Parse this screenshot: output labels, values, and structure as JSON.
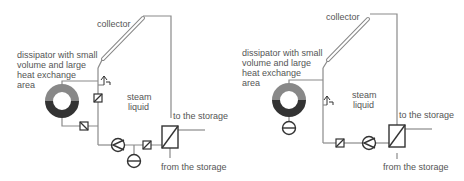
{
  "panels": [
    {
      "id": "left",
      "labels": {
        "collector": "collector",
        "dissipator_line1": "dissipator with small",
        "dissipator_line2": "volume and large",
        "dissipator_line3": "heat exchange",
        "dissipator_line4": "area",
        "steam": "steam",
        "liquid": "liquid",
        "to_storage": "to the storage",
        "from_storage": "from the storage"
      }
    },
    {
      "id": "right",
      "labels": {
        "collector": "collector",
        "dissipator_line1": "dissipator with small",
        "dissipator_line2": "volume and large",
        "dissipator_line3": "heat exchange",
        "dissipator_line4": "area",
        "steam": "steam",
        "liquid": "liquid",
        "to_storage": "to the storage",
        "from_storage": "from the storage"
      }
    }
  ],
  "colors": {
    "pipe": "#8a8a8a",
    "symbol": "#333333",
    "dissipator_top": "#888888",
    "dissipator_bottom": "#333333",
    "text": "#555555"
  }
}
